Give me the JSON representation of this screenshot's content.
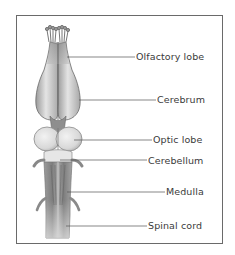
{
  "diagram": {
    "labels": [
      {
        "text": "Olfactory lobe",
        "x": 136,
        "y": 51,
        "line_from_x": 70,
        "line_y": 57
      },
      {
        "text": "Cerebrum",
        "x": 157,
        "y": 94,
        "line_from_x": 82,
        "line_y": 100
      },
      {
        "text": "Optic lobe",
        "x": 153,
        "y": 134,
        "line_from_x": 78,
        "line_y": 140
      },
      {
        "text": "Cerebellum",
        "x": 148,
        "y": 155,
        "line_from_x": 62,
        "line_y": 160
      },
      {
        "text": "Medulla",
        "x": 166,
        "y": 186,
        "line_from_x": 68,
        "line_y": 192
      },
      {
        "text": "Spinal cord",
        "x": 148,
        "y": 220,
        "line_from_x": 68,
        "line_y": 226
      }
    ],
    "colors": {
      "frame": "#6a6a6a",
      "leader_line": "#555555",
      "label_text": "#3a3a3a",
      "tissue_light": "#e8e8e8",
      "tissue_mid": "#b5b5b5",
      "tissue_dark": "#7a7a7a"
    }
  }
}
